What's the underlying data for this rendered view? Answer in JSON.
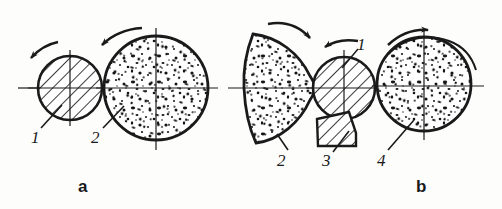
{
  "figure": {
    "type": "technical-line-diagram",
    "background_color": "#fdfdfc",
    "ink_color": "#1a1a1a",
    "width": 502,
    "height": 209,
    "panels": [
      {
        "id": "a",
        "label": "a",
        "parts": [
          {
            "number": "1",
            "name": "hatched-roller",
            "fill_pattern": "diagonal-hatching",
            "shape": "circle",
            "center_x": 70,
            "center_y": 88,
            "radius": 32,
            "rotation_arrow": "counterclockwise"
          },
          {
            "number": "2",
            "name": "speckled-workpiece",
            "fill_pattern": "stipple-speckle",
            "shape": "circle",
            "center_x": 156,
            "center_y": 88,
            "radius": 52,
            "rotation_arrow": "counterclockwise"
          }
        ]
      },
      {
        "id": "b",
        "label": "b",
        "parts": [
          {
            "number": "2",
            "name": "speckled-crescent-workpiece",
            "fill_pattern": "stipple-speckle",
            "shape": "crescent-lens",
            "rotation_arrow": "clockwise"
          },
          {
            "number": "1",
            "name": "hatched-roller",
            "fill_pattern": "diagonal-hatching",
            "shape": "circle",
            "center_x": 344,
            "center_y": 88,
            "radius": 31,
            "rotation_arrow": "counterclockwise"
          },
          {
            "number": "3",
            "name": "hatched-cutting-tool",
            "fill_pattern": "diagonal-hatching",
            "shape": "quadrilateral"
          },
          {
            "number": "4",
            "name": "speckled-workpiece-with-removed-layer",
            "fill_pattern": "stipple-speckle",
            "shape": "circle",
            "center_x": 424,
            "center_y": 84,
            "radius": 47,
            "rotation_arrow": "clockwise"
          }
        ]
      }
    ],
    "labels": {
      "panel_a": "a",
      "panel_b": "b",
      "a_part_1": "1",
      "a_part_2": "2",
      "b_part_1": "1",
      "b_part_2": "2",
      "b_part_3": "3",
      "b_part_4": "4"
    }
  }
}
